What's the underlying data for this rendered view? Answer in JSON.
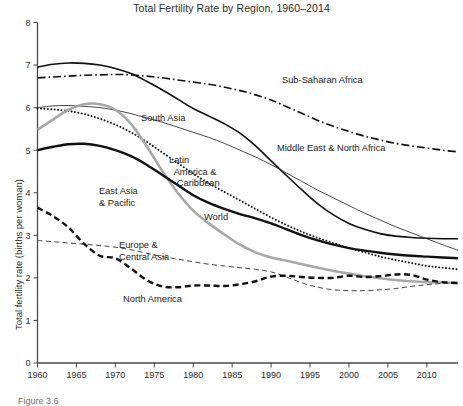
{
  "figure": {
    "caption": "Figure 3.6"
  },
  "chart_data": {
    "type": "line",
    "title": "Total Fertility Rate by Region, 1960–2014",
    "xlabel": "",
    "ylabel": "Total fertility rate (births per woman)",
    "xlim": [
      1960,
      2014
    ],
    "ylim": [
      0,
      8
    ],
    "grid": false,
    "legend_position": "inline-labels",
    "xticks": [
      1960,
      1965,
      1970,
      1975,
      1980,
      1985,
      1990,
      1995,
      2000,
      2005,
      2010
    ],
    "xtick_labels": [
      "1960",
      "1965",
      "1970",
      "1975",
      "1980",
      "1985",
      "1990",
      "1995",
      "2000",
      "2005",
      "2010"
    ],
    "yticks": [
      0,
      1,
      2,
      3,
      4,
      5,
      6,
      7,
      8
    ],
    "ytick_labels": [
      "0",
      "1",
      "2",
      "3",
      "4",
      "5",
      "6",
      "7",
      "8"
    ],
    "x": [
      1960,
      1962,
      1964,
      1966,
      1968,
      1970,
      1972,
      1974,
      1976,
      1978,
      1980,
      1982,
      1984,
      1986,
      1988,
      1990,
      1992,
      1994,
      1996,
      1998,
      2000,
      2002,
      2004,
      2006,
      2008,
      2010,
      2012,
      2014
    ],
    "series": [
      {
        "name": "Sub-Saharan Africa",
        "style": "dash-dot",
        "color": "#111111",
        "width": 1.6,
        "label_x": 282,
        "label_y": 75,
        "values": [
          6.7,
          6.72,
          6.74,
          6.76,
          6.77,
          6.78,
          6.77,
          6.74,
          6.7,
          6.65,
          6.6,
          6.55,
          6.48,
          6.4,
          6.3,
          6.18,
          6.02,
          5.86,
          5.7,
          5.56,
          5.44,
          5.33,
          5.24,
          5.16,
          5.1,
          5.05,
          5.0,
          4.96
        ]
      },
      {
        "name": "Middle East & North Africa",
        "style": "solid",
        "color": "#111111",
        "width": 1.6,
        "label_x": 277,
        "label_y": 143,
        "values": [
          6.95,
          7.02,
          7.05,
          7.04,
          7.0,
          6.92,
          6.8,
          6.62,
          6.42,
          6.2,
          5.98,
          5.8,
          5.62,
          5.4,
          5.1,
          4.75,
          4.4,
          4.06,
          3.74,
          3.48,
          3.28,
          3.14,
          3.04,
          2.98,
          2.95,
          2.93,
          2.92,
          2.92
        ]
      },
      {
        "name": "South Asia",
        "style": "solid",
        "color": "#333333",
        "width": 0.9,
        "label_x": 141,
        "label_y": 113,
        "values": [
          6.0,
          6.04,
          6.05,
          6.03,
          6.0,
          5.94,
          5.86,
          5.76,
          5.66,
          5.54,
          5.42,
          5.3,
          5.16,
          5.0,
          4.84,
          4.66,
          4.46,
          4.26,
          4.06,
          3.88,
          3.7,
          3.52,
          3.36,
          3.2,
          3.06,
          2.92,
          2.78,
          2.65
        ]
      },
      {
        "name": "Latin America & Caribbean",
        "style": "dotted",
        "color": "#111111",
        "width": 1.9,
        "label_x": 169,
        "label_y": 155,
        "label_lines": [
          "Latin",
          "America &",
          "Caribbean"
        ],
        "values": [
          5.98,
          5.96,
          5.92,
          5.85,
          5.74,
          5.6,
          5.42,
          5.2,
          4.95,
          4.7,
          4.45,
          4.22,
          4.02,
          3.82,
          3.62,
          3.42,
          3.24,
          3.08,
          2.94,
          2.82,
          2.7,
          2.6,
          2.5,
          2.42,
          2.35,
          2.28,
          2.24,
          2.2
        ]
      },
      {
        "name": "East Asia & Pacific",
        "style": "solid",
        "color": "#a8a8a8",
        "width": 2.6,
        "label_x": 99,
        "label_y": 186,
        "label_lines": [
          "East Asia",
          "& Pacific"
        ],
        "values": [
          5.48,
          5.72,
          5.95,
          6.08,
          6.08,
          5.95,
          5.62,
          5.1,
          4.52,
          4.0,
          3.58,
          3.28,
          3.02,
          2.78,
          2.6,
          2.48,
          2.4,
          2.32,
          2.24,
          2.16,
          2.1,
          2.04,
          1.99,
          1.95,
          1.92,
          1.9,
          1.89,
          1.88
        ]
      },
      {
        "name": "World",
        "style": "solid",
        "color": "#111111",
        "width": 2.4,
        "label_x": 204,
        "label_y": 212,
        "values": [
          5.0,
          5.08,
          5.14,
          5.15,
          5.1,
          5.0,
          4.86,
          4.66,
          4.42,
          4.18,
          3.94,
          3.76,
          3.62,
          3.5,
          3.4,
          3.28,
          3.14,
          3.0,
          2.88,
          2.78,
          2.7,
          2.64,
          2.59,
          2.55,
          2.52,
          2.5,
          2.48,
          2.46
        ]
      },
      {
        "name": "Europe & Central Asia",
        "style": "dashed-thin",
        "color": "#444444",
        "width": 1.0,
        "label_x": 119,
        "label_y": 240,
        "label_lines": [
          "Europe &",
          "Central Asia"
        ],
        "values": [
          2.88,
          2.85,
          2.82,
          2.79,
          2.76,
          2.72,
          2.66,
          2.58,
          2.5,
          2.44,
          2.38,
          2.32,
          2.28,
          2.24,
          2.2,
          2.14,
          2.02,
          1.88,
          1.78,
          1.72,
          1.7,
          1.7,
          1.72,
          1.75,
          1.8,
          1.84,
          1.87,
          1.88
        ]
      },
      {
        "name": "North America",
        "style": "dashed-thick",
        "color": "#111111",
        "width": 2.4,
        "label_x": 123,
        "label_y": 294,
        "values": [
          3.65,
          3.45,
          3.18,
          2.8,
          2.52,
          2.46,
          2.22,
          1.95,
          1.8,
          1.78,
          1.82,
          1.82,
          1.81,
          1.85,
          1.92,
          2.03,
          2.05,
          2.02,
          2.0,
          2.0,
          2.05,
          2.02,
          2.04,
          2.08,
          2.07,
          1.96,
          1.9,
          1.88
        ]
      }
    ]
  }
}
